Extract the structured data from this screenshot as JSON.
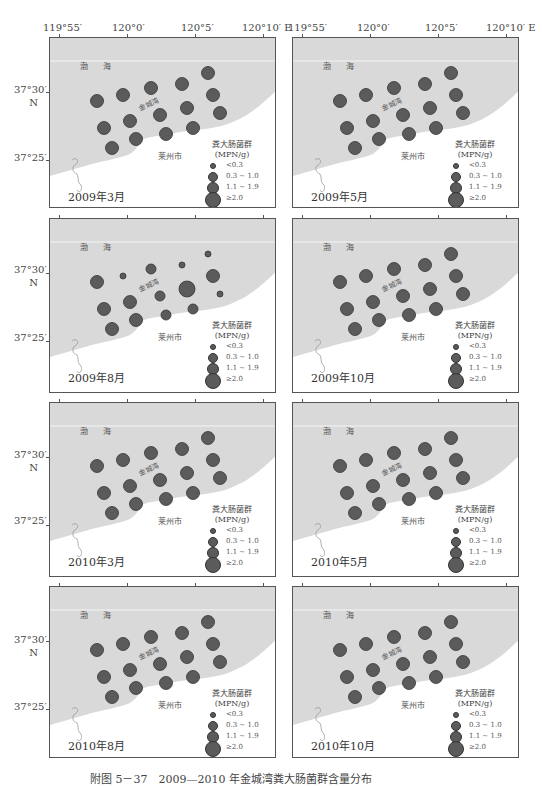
{
  "axes": {
    "lon_ticks_left": [
      "119°55′",
      "120°0′",
      "120°5′",
      "120°10′ E"
    ],
    "lon_ticks_right": [
      "119°55′",
      "120°0′",
      "120°5′",
      "120°10′ E"
    ],
    "lat_ticks": [
      "37°30′",
      "N",
      "37°25′"
    ]
  },
  "labels": {
    "sea": "渤 海",
    "bay": "金城湾",
    "city": "莱州市"
  },
  "legend": {
    "title_line1": "粪大肠菌群",
    "title_line2": "(MPN/g)",
    "items": [
      "<0.3",
      "0.3 ~ 1.0",
      "1.1 ~ 1.9",
      "≥2.0"
    ]
  },
  "colors": {
    "sea": "#d9d9d9",
    "land": "#ffffff",
    "dot": "#5b5b5b",
    "dot_border": "#333333"
  },
  "caption": "附图 5－37　2009—2010 年金城湾粪大肠菌群含量分布",
  "chart_data": {
    "type": "scatter",
    "title": "2009—2010 年金城湾粪大肠菌群含量分布",
    "xlabel": "Longitude (E)",
    "ylabel": "Latitude (N)",
    "x_ticks": [
      "119°55′",
      "120°0′",
      "120°5′",
      "120°10′"
    ],
    "y_ticks": [
      "37°30′",
      "37°25′"
    ],
    "legend": [
      "<0.3",
      "0.3~1.0",
      "1.1~1.9",
      "≥2.0"
    ],
    "size_classes": {
      "<0.3": 1,
      "0.3~1.0": 2,
      "1.1~1.9": 3,
      "≥2.0": 4
    },
    "stations": [
      {
        "id": 1,
        "x": 47,
        "y": 63
      },
      {
        "id": 2,
        "x": 73,
        "y": 57
      },
      {
        "id": 3,
        "x": 101,
        "y": 50
      },
      {
        "id": 4,
        "x": 132,
        "y": 46
      },
      {
        "id": 5,
        "x": 158,
        "y": 35
      },
      {
        "id": 6,
        "x": 163,
        "y": 57
      },
      {
        "id": 7,
        "x": 137,
        "y": 70
      },
      {
        "id": 8,
        "x": 110,
        "y": 77
      },
      {
        "id": 9,
        "x": 80,
        "y": 83
      },
      {
        "id": 10,
        "x": 54,
        "y": 90
      },
      {
        "id": 11,
        "x": 86,
        "y": 101
      },
      {
        "id": 12,
        "x": 116,
        "y": 96
      },
      {
        "id": 13,
        "x": 143,
        "y": 90
      },
      {
        "id": 14,
        "x": 170,
        "y": 75
      },
      {
        "id": 15,
        "x": 62,
        "y": 110
      }
    ],
    "panels": [
      {
        "name": "2009年3月",
        "classes": [
          3,
          3,
          3,
          3,
          3,
          3,
          3,
          3,
          3,
          3,
          3,
          3,
          3,
          3,
          3
        ]
      },
      {
        "name": "2009年5月",
        "classes": [
          3,
          3,
          3,
          3,
          3,
          3,
          3,
          3,
          3,
          3,
          3,
          3,
          3,
          3,
          3
        ]
      },
      {
        "name": "2009年8月",
        "classes": [
          3,
          1,
          2,
          1,
          1,
          3,
          4,
          2,
          3,
          3,
          3,
          2,
          2,
          1,
          3
        ]
      },
      {
        "name": "2009年10月",
        "classes": [
          3,
          3,
          3,
          3,
          3,
          3,
          3,
          3,
          3,
          3,
          3,
          3,
          3,
          3,
          3
        ]
      },
      {
        "name": "2010年3月",
        "classes": [
          3,
          3,
          3,
          3,
          3,
          3,
          3,
          3,
          3,
          3,
          3,
          3,
          3,
          3,
          3
        ]
      },
      {
        "name": "2010年5月",
        "classes": [
          3,
          3,
          3,
          3,
          3,
          3,
          3,
          3,
          3,
          3,
          3,
          3,
          3,
          3,
          3
        ]
      },
      {
        "name": "2010年8月",
        "classes": [
          3,
          3,
          3,
          3,
          3,
          3,
          3,
          3,
          3,
          3,
          3,
          3,
          3,
          3,
          3
        ]
      },
      {
        "name": "2010年10月",
        "classes": [
          3,
          3,
          3,
          3,
          3,
          3,
          3,
          3,
          3,
          3,
          3,
          3,
          3,
          3,
          3
        ]
      }
    ]
  }
}
